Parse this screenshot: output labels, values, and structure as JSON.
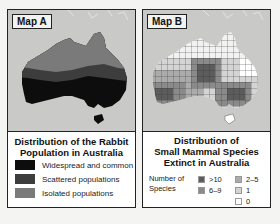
{
  "map_a": {
    "badge": "Map A",
    "title_line1": "Distribution of the Rabbit",
    "title_line2": "Population in Australia",
    "legend": [
      {
        "label": "Widespread and common",
        "color": "#0d0d0d"
      },
      {
        "label": "Scattered populations",
        "color": "#3d3d3d"
      },
      {
        "label": "Isolated populations",
        "color": "#7a7a7a"
      }
    ]
  },
  "map_b": {
    "badge": "Map B",
    "title_line1": "Distribution of",
    "title_line2": "Small Mammal Species",
    "title_line3": "Extinct in Australia",
    "legend_label_line1": "Number of",
    "legend_label_line2": "Species",
    "legend": [
      {
        "label": ">10",
        "color": "#5c5c5c"
      },
      {
        "label": "6–9",
        "color": "#8a8a8a"
      },
      {
        "label": "2–5",
        "color": "#ababab"
      },
      {
        "label": "1",
        "color": "#d4d4d4"
      },
      {
        "label": "0",
        "color": "#ffffff"
      }
    ]
  },
  "colors": {
    "ocean": "#c9c9c7",
    "border": "#222222",
    "background": "#f4f4f2"
  }
}
